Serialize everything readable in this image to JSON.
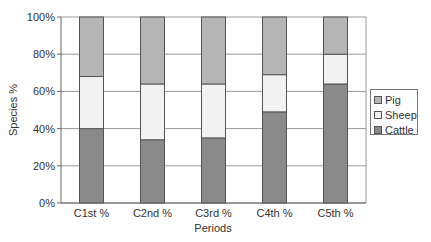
{
  "chart_data": {
    "type": "bar",
    "stacked": true,
    "normalized_percent": true,
    "title": "",
    "xlabel": "Periods",
    "ylabel": "Species %",
    "ylim": [
      0,
      100
    ],
    "yticks": [
      "0%",
      "20%",
      "40%",
      "60%",
      "80%",
      "100%"
    ],
    "grid": true,
    "legend_position": "right",
    "categories": [
      "C1st %",
      "C2nd %",
      "C3rd %",
      "C4th %",
      "C5th %"
    ],
    "series": [
      {
        "name": "Cattle",
        "color": "#8a8a8a",
        "values": [
          40,
          34,
          35,
          49,
          64
        ]
      },
      {
        "name": "Sheep",
        "color": "#f2f2f2",
        "values": [
          28,
          30,
          29,
          20,
          16
        ]
      },
      {
        "name": "Pig",
        "color": "#b5b5b5",
        "values": [
          32,
          36,
          36,
          31,
          20
        ]
      }
    ]
  },
  "legend": {
    "items": [
      {
        "label": "Pig",
        "color": "#b5b5b5"
      },
      {
        "label": "Sheep",
        "color": "#f2f2f2"
      },
      {
        "label": "Cattle",
        "color": "#8a8a8a"
      }
    ]
  }
}
